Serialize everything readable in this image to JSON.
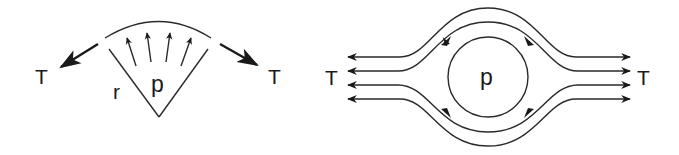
{
  "figure": {
    "colors": {
      "stroke": "#2a2a2a",
      "background": "#ffffff"
    }
  },
  "left_diagram": {
    "labels": {
      "tension_left": "T",
      "tension_right": "T",
      "radius": "r",
      "pressure": "p"
    },
    "pressure_arrow_count": 4
  },
  "right_diagram": {
    "labels": {
      "tension_left": "T",
      "tension_right": "T",
      "pressure": "p"
    },
    "horizontal_line_count": 4
  }
}
